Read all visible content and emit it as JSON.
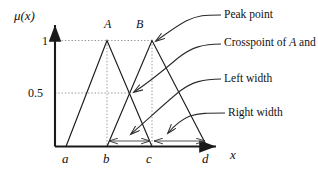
{
  "figure": {
    "type": "fuzzy-membership-triangular-sets-diagram",
    "axes": {
      "y_label": "μ(x)",
      "x_label": "x",
      "y_ticks": [
        {
          "value": "1",
          "label": "1"
        },
        {
          "value": "0.5",
          "label": "0.5"
        }
      ],
      "x_ticks": [
        {
          "label": "a"
        },
        {
          "label": "b"
        },
        {
          "label": "c"
        },
        {
          "label": "d"
        }
      ]
    },
    "sets": [
      {
        "label": "A",
        "peak_label": "A"
      },
      {
        "label": "B",
        "peak_label": "B"
      }
    ],
    "annotations": [
      {
        "id": "peak-point",
        "text": "Peak point"
      },
      {
        "id": "crosspoint",
        "text_pre": "Crosspoint of ",
        "text_a": "A",
        "text_mid": " and ",
        "text_b": "B"
      },
      {
        "id": "left-width",
        "text": "Left width"
      },
      {
        "id": "right-width",
        "text": "Right width"
      }
    ],
    "colors": {
      "line": "#1a1a1a",
      "dotted": "#8c8c8c",
      "measure": "#555555",
      "background": "#ffffff"
    }
  }
}
